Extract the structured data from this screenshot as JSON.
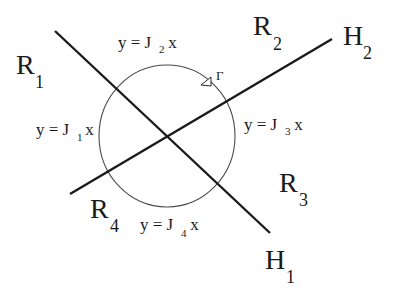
{
  "diagram": {
    "colors": {
      "line": "#1a1a1a",
      "circle": "#4a4a4a",
      "text": "#1a1a1a",
      "background": "#ffffff"
    },
    "lines": [
      {
        "id": "H1",
        "label": "H",
        "subscript": "1",
        "from": [
          55,
          31
        ],
        "to": [
          270,
          233
        ]
      },
      {
        "id": "H2",
        "label": "H",
        "subscript": "2",
        "from": [
          70,
          194
        ],
        "to": [
          332,
          39
        ]
      }
    ],
    "circle": {
      "label": "Γ",
      "center": [
        167,
        136
      ],
      "rx": 68,
      "ry": 71,
      "orientation_arrow": "counterclockwise-marker"
    },
    "regions": [
      {
        "label": "R",
        "subscript": "1"
      },
      {
        "label": "R",
        "subscript": "2"
      },
      {
        "label": "R",
        "subscript": "3"
      },
      {
        "label": "R",
        "subscript": "4"
      }
    ],
    "equations": [
      {
        "prefix": "y = J",
        "subscript": "1",
        "suffix": " x"
      },
      {
        "prefix": "y = J",
        "subscript": "2",
        "suffix": " x"
      },
      {
        "prefix": "y = J",
        "subscript": "3",
        "suffix": " x"
      },
      {
        "prefix": "y = J",
        "subscript": "4",
        "suffix": " x"
      }
    ],
    "hyperplanes": [
      {
        "label": "H",
        "subscript": "1"
      },
      {
        "label": "H",
        "subscript": "2"
      }
    ],
    "gamma_label": "Γ"
  }
}
